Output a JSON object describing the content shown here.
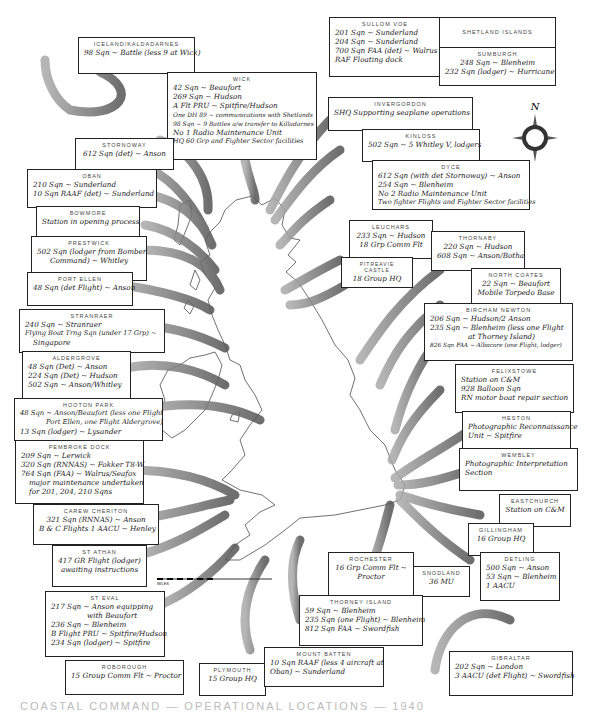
{
  "compass": {
    "label": "N"
  },
  "scale": {
    "ticks": [
      "100",
      "50",
      "0",
      "100"
    ],
    "unit": "MILES"
  },
  "footer": {
    "text": "COASTAL COMMAND — OPERATIONAL LOCATIONS — 1940"
  },
  "stations": [
    {
      "id": "iceland",
      "title": "ICELAND/KALDADARNES",
      "lines": [
        "98 Sqn ~ Battle (less 9 at Wick)"
      ]
    },
    {
      "id": "wick",
      "title": "WICK",
      "lines": [
        "42 Sqn ~ Beaufort",
        "269 Sqn ~ Hudson",
        "A Flt PRU ~ Spitfire/Hudson",
        "One DH 89 ~ communications with Shetlands",
        "98 Sqn ~ 9 Battles a/w transfer to Killadarnes",
        "No 1 Radio Maintenance Unit",
        "HQ 60 Grp and Fighter Sector facilities"
      ]
    },
    {
      "id": "sullomvoe",
      "title": "SULLOM VOE",
      "lines": [
        "201 Sqn ~ Sunderland",
        "204 Sqn ~ Sunderland",
        "700 Sqn FAA (det) ~ Walrus",
        "RAF Floating dock"
      ]
    },
    {
      "id": "shetland",
      "title": "SHETLAND ISLANDS",
      "lines": []
    },
    {
      "id": "sumburgh",
      "title": "SUMBURGH",
      "lines": [
        "248 Sqn ~ Blenheim",
        "232 Sqn (lodger) ~ Hurricane"
      ]
    },
    {
      "id": "invergordon",
      "title": "INVERGORDON",
      "lines": [
        "SHQ Supporting seaplane operations"
      ]
    },
    {
      "id": "kinloss",
      "title": "KINLOSS",
      "lines": [
        "502 Sqn ~ 5 Whitley V, lodgers"
      ]
    },
    {
      "id": "stornoway",
      "title": "STORNOWAY",
      "lines": [
        "612 Sqn (det) ~ Anson"
      ]
    },
    {
      "id": "oban",
      "title": "OBAN",
      "lines": [
        "210 Sqn ~ Sunderland",
        "10 Sqn RAAF (det) ~ Sunderland"
      ]
    },
    {
      "id": "bowmore",
      "title": "BOWMORE",
      "lines": [
        "Station in opening process"
      ]
    },
    {
      "id": "dyce",
      "title": "DYCE",
      "lines": [
        "612 Sqn (with det Stornoway) ~ Anson",
        "254 Sqn ~ Blenheim",
        "No 2 Radio Maintenance Unit",
        "Two fighter Flights and Fighter Sector facilities"
      ]
    },
    {
      "id": "prestwick",
      "title": "PRESTWICK",
      "lines": [
        "502 Sqn (lodger from Bomber",
        "Command) ~ Whitley"
      ]
    },
    {
      "id": "leuchars",
      "title": "LEUCHARS",
      "lines": [
        "233 Sqn ~ Hudson",
        "18 Grp Comm Flt"
      ]
    },
    {
      "id": "thornaby",
      "title": "THORNABY",
      "lines": [
        "220 Sqn ~ Hudson",
        "608 Sqn ~ Anson/Botha"
      ]
    },
    {
      "id": "pitreavie",
      "title": "PITREAVIE CASTLE",
      "lines": [
        "18 Group HQ"
      ]
    },
    {
      "id": "portellen",
      "title": "PORT ELLEN",
      "lines": [
        "48 Sqn (det Flight) ~ Anson"
      ]
    },
    {
      "id": "northcoates",
      "title": "NORTH COATES",
      "lines": [
        "22 Sqn ~ Beaufort",
        "Mobile Torpedo Base"
      ]
    },
    {
      "id": "stranraer",
      "title": "STRANRAER",
      "lines": [
        "240 Sqn ~ Stranraer",
        "Flying Boat Trng Sqn (under 17 Grp) ~",
        "Singapore"
      ]
    },
    {
      "id": "bircham",
      "title": "BIRCHAM NEWTON",
      "lines": [
        "206 Sqn ~ Hudson/2 Anson",
        "235 Sqn ~ Blenheim (less one Flight",
        "at Thorney Island)",
        "826 Sqn FAA ~ Albacore (one Flight, lodger)"
      ]
    },
    {
      "id": "aldergrove",
      "title": "ALDERGROVE",
      "lines": [
        "48 Sqn (Det) ~ Anson",
        "224 Sqn (Det) ~ Hudson",
        "502 Sqn ~ Anson/Whitley"
      ]
    },
    {
      "id": "felixstowe",
      "title": "FELIXSTOWE",
      "lines": [
        "Station on C&M",
        "928 Balloon Sqn",
        "RN motor boat repair section"
      ]
    },
    {
      "id": "hooton",
      "title": "HOOTON PARK",
      "lines": [
        "48 Sqn ~ Anson/Beaufort (less one Flight",
        "Port Ellen, one Flight Aldergrove)",
        "13 Sqn (lodger) ~ Lysander"
      ]
    },
    {
      "id": "heston",
      "title": "HESTON",
      "lines": [
        "Photographic Reconnaissance",
        "Unit ~ Spitfire"
      ]
    },
    {
      "id": "pembroke",
      "title": "PEMBROKE DOCK",
      "lines": [
        "209 Sqn ~ Lerwick",
        "320 Sqn (RNNAS) ~ Fokker T8-W",
        "764 Sqn (FAA) ~ Walrus/Seafox",
        "major maintenance undertaken",
        "for 201, 204, 210 Sqns"
      ]
    },
    {
      "id": "wembley",
      "title": "WEMBLEY",
      "lines": [
        "Photographic Interpretation",
        "Section"
      ]
    },
    {
      "id": "eastchurch",
      "title": "EASTCHURCH",
      "lines": [
        "Station on C&M"
      ]
    },
    {
      "id": "carew",
      "title": "CAREW CHERITON",
      "lines": [
        "321 Sqn (RNNAS) ~ Anson",
        "B & C Flights 1 AACU ~ Henley"
      ]
    },
    {
      "id": "gillingham",
      "title": "GILLINGHAM",
      "lines": [
        "16 Group HQ"
      ]
    },
    {
      "id": "stathan",
      "title": "ST ATHAN",
      "lines": [
        "417 GR Flight (lodger)",
        "awaiting instructions"
      ]
    },
    {
      "id": "detling",
      "title": "DETLING",
      "lines": [
        "500 Sqn ~ Anson",
        "53 Sqn ~ Blenheim",
        "1 AACU"
      ]
    },
    {
      "id": "rochester",
      "title": "ROCHESTER",
      "lines": [
        "16 Grp Comm Flt ~",
        "Proctor"
      ]
    },
    {
      "id": "snodland",
      "title": "SNODLAND",
      "lines": [
        "36 MU"
      ]
    },
    {
      "id": "steval",
      "title": "ST EVAL",
      "lines": [
        "217 Sqn ~ Anson equipping",
        "with Beaufort",
        "236 Sqn ~ Blenheim",
        "B Flight PRU ~ Spitfire/Hudson",
        "234 Sqn (lodger) ~ Spitfire"
      ]
    },
    {
      "id": "thorney",
      "title": "THORNEY ISLAND",
      "lines": [
        "59 Sqn ~ Blenheim",
        "235 Sqn (one Flight) ~ Blenheim",
        "812 Sqn FAA ~ Swordfish"
      ]
    },
    {
      "id": "roborough",
      "title": "ROBOROUGH",
      "lines": [
        "15 Group Comm Flt ~ Proctor"
      ]
    },
    {
      "id": "plymouth",
      "title": "PLYMOUTH",
      "lines": [
        "15 Group HQ"
      ]
    },
    {
      "id": "mountbatten",
      "title": "MOUNT BATTEN",
      "lines": [
        "10 Sqn RAAF (less 4 aircraft at",
        "Oban) ~ Sunderland"
      ]
    },
    {
      "id": "gibraltar",
      "title": "GIBRALTAR",
      "lines": [
        "202 Sqn ~ London",
        "3 AACU (det Flight) ~ Swordfish"
      ]
    }
  ]
}
